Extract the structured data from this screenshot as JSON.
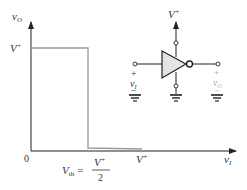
{
  "diagram": {
    "type": "inverter voltage transfer characteristic",
    "y_axis_label": "v",
    "y_axis_sub": "O",
    "x_axis_label": "v",
    "x_axis_sub": "I",
    "origin_label": "0",
    "y_high_label": "V",
    "y_high_sup": "+",
    "x_vth_label": "V",
    "x_vth_sub": "th",
    "x_vth_eq": "=",
    "x_vth_num": "V",
    "x_vth_num_sup": "+",
    "x_vth_den": "2",
    "x_vplus_label": "V",
    "x_vplus_sup": "+"
  },
  "circuit": {
    "supply_label": "V",
    "supply_sup": "+",
    "input_plus": "+",
    "input_label": "v",
    "input_sub": "I",
    "input_minus": "−",
    "output_plus": "+",
    "output_label": "v",
    "output_sub": "O",
    "output_minus": "−"
  },
  "colors": {
    "axis": "#222222",
    "curve": "#9a9a9a",
    "inverter_fill": "#e4e4e4",
    "output_label": "#aaaaaa"
  }
}
